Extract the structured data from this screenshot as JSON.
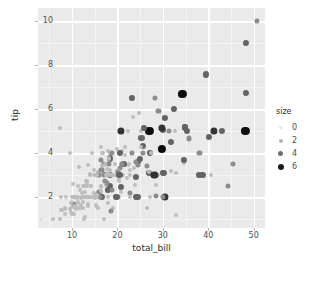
{
  "chart_data": {
    "type": "scatter",
    "title": "",
    "xlabel": "total_bill",
    "ylabel": "tip",
    "xlim": [
      2.5,
      52.5
    ],
    "ylim": [
      0.6,
      10.6
    ],
    "xticks": [
      10,
      20,
      30,
      40,
      50
    ],
    "yticks": [
      2,
      4,
      6,
      8,
      10
    ],
    "grid": true,
    "panel_background": "#eaeaea",
    "grid_color": "#ffffff",
    "legend": {
      "title": "size",
      "position": "right",
      "entries": [
        {
          "label": "0",
          "color": "#e3e3e3",
          "radius": 1.6
        },
        {
          "label": "2",
          "color": "#b4b4b4",
          "radius": 2.0
        },
        {
          "label": "4",
          "color": "#6e6e6e",
          "radius": 2.5
        },
        {
          "label": "6",
          "color": "#1a1a1a",
          "radius": 3.0
        }
      ]
    },
    "color_by": "size",
    "colormap": {
      "1": "#d9d9d9",
      "2": "#bdbdbd",
      "3": "#8c8c8c",
      "4": "#636363",
      "5": "#333333",
      "6": "#0d0d0d"
    },
    "size_by": "size",
    "points": [
      {
        "x": 16.99,
        "y": 1.01,
        "s": 2
      },
      {
        "x": 10.34,
        "y": 1.66,
        "s": 3
      },
      {
        "x": 21.01,
        "y": 3.5,
        "s": 3
      },
      {
        "x": 23.68,
        "y": 3.31,
        "s": 2
      },
      {
        "x": 24.59,
        "y": 3.61,
        "s": 4
      },
      {
        "x": 25.29,
        "y": 4.71,
        "s": 4
      },
      {
        "x": 8.77,
        "y": 2.0,
        "s": 2
      },
      {
        "x": 26.88,
        "y": 3.12,
        "s": 4
      },
      {
        "x": 15.04,
        "y": 1.96,
        "s": 2
      },
      {
        "x": 14.78,
        "y": 3.23,
        "s": 2
      },
      {
        "x": 10.27,
        "y": 1.71,
        "s": 2
      },
      {
        "x": 35.26,
        "y": 5.0,
        "s": 4
      },
      {
        "x": 15.42,
        "y": 1.57,
        "s": 2
      },
      {
        "x": 18.43,
        "y": 3.0,
        "s": 4
      },
      {
        "x": 14.83,
        "y": 3.02,
        "s": 2
      },
      {
        "x": 21.58,
        "y": 3.92,
        "s": 2
      },
      {
        "x": 10.33,
        "y": 1.67,
        "s": 3
      },
      {
        "x": 16.29,
        "y": 3.71,
        "s": 3
      },
      {
        "x": 16.97,
        "y": 3.5,
        "s": 3
      },
      {
        "x": 20.65,
        "y": 3.35,
        "s": 3
      },
      {
        "x": 17.92,
        "y": 4.08,
        "s": 2
      },
      {
        "x": 20.29,
        "y": 2.75,
        "s": 2
      },
      {
        "x": 15.77,
        "y": 2.23,
        "s": 2
      },
      {
        "x": 39.42,
        "y": 7.58,
        "s": 4
      },
      {
        "x": 19.82,
        "y": 3.18,
        "s": 2
      },
      {
        "x": 17.81,
        "y": 2.34,
        "s": 4
      },
      {
        "x": 13.37,
        "y": 2.0,
        "s": 2
      },
      {
        "x": 12.69,
        "y": 2.0,
        "s": 2
      },
      {
        "x": 21.7,
        "y": 4.3,
        "s": 2
      },
      {
        "x": 19.65,
        "y": 3.0,
        "s": 2
      },
      {
        "x": 9.55,
        "y": 1.45,
        "s": 2
      },
      {
        "x": 18.35,
        "y": 2.5,
        "s": 4
      },
      {
        "x": 15.06,
        "y": 3.0,
        "s": 2
      },
      {
        "x": 20.69,
        "y": 2.45,
        "s": 4
      },
      {
        "x": 17.78,
        "y": 3.27,
        "s": 2
      },
      {
        "x": 24.06,
        "y": 3.6,
        "s": 3
      },
      {
        "x": 16.31,
        "y": 2.0,
        "s": 3
      },
      {
        "x": 16.93,
        "y": 3.07,
        "s": 3
      },
      {
        "x": 18.69,
        "y": 2.31,
        "s": 3
      },
      {
        "x": 31.27,
        "y": 5.0,
        "s": 3
      },
      {
        "x": 16.04,
        "y": 2.24,
        "s": 3
      },
      {
        "x": 17.46,
        "y": 2.54,
        "s": 2
      },
      {
        "x": 13.94,
        "y": 3.06,
        "s": 2
      },
      {
        "x": 9.68,
        "y": 1.32,
        "s": 2
      },
      {
        "x": 30.4,
        "y": 5.6,
        "s": 4
      },
      {
        "x": 18.29,
        "y": 3.0,
        "s": 2
      },
      {
        "x": 22.23,
        "y": 5.0,
        "s": 2
      },
      {
        "x": 32.4,
        "y": 6.0,
        "s": 4
      },
      {
        "x": 28.55,
        "y": 2.05,
        "s": 3
      },
      {
        "x": 18.04,
        "y": 3.0,
        "s": 2
      },
      {
        "x": 12.54,
        "y": 2.5,
        "s": 2
      },
      {
        "x": 10.29,
        "y": 2.6,
        "s": 2
      },
      {
        "x": 34.81,
        "y": 5.2,
        "s": 4
      },
      {
        "x": 9.94,
        "y": 1.56,
        "s": 2
      },
      {
        "x": 25.56,
        "y": 4.34,
        "s": 4
      },
      {
        "x": 19.49,
        "y": 3.51,
        "s": 2
      },
      {
        "x": 38.01,
        "y": 3.0,
        "s": 4
      },
      {
        "x": 26.41,
        "y": 1.5,
        "s": 2
      },
      {
        "x": 11.24,
        "y": 1.76,
        "s": 2
      },
      {
        "x": 48.27,
        "y": 6.73,
        "s": 4
      },
      {
        "x": 20.29,
        "y": 3.21,
        "s": 2
      },
      {
        "x": 13.81,
        "y": 2.0,
        "s": 2
      },
      {
        "x": 11.02,
        "y": 1.98,
        "s": 2
      },
      {
        "x": 18.29,
        "y": 3.76,
        "s": 4
      },
      {
        "x": 17.59,
        "y": 2.64,
        "s": 3
      },
      {
        "x": 20.08,
        "y": 3.15,
        "s": 3
      },
      {
        "x": 16.45,
        "y": 2.47,
        "s": 2
      },
      {
        "x": 3.07,
        "y": 1.0,
        "s": 1
      },
      {
        "x": 20.23,
        "y": 2.01,
        "s": 2
      },
      {
        "x": 15.01,
        "y": 2.09,
        "s": 2
      },
      {
        "x": 12.02,
        "y": 1.97,
        "s": 2
      },
      {
        "x": 17.07,
        "y": 3.0,
        "s": 3
      },
      {
        "x": 26.86,
        "y": 3.14,
        "s": 2
      },
      {
        "x": 25.28,
        "y": 5.0,
        "s": 2
      },
      {
        "x": 14.73,
        "y": 2.2,
        "s": 2
      },
      {
        "x": 10.51,
        "y": 1.25,
        "s": 2
      },
      {
        "x": 17.92,
        "y": 3.08,
        "s": 2
      },
      {
        "x": 27.2,
        "y": 4.0,
        "s": 4
      },
      {
        "x": 22.76,
        "y": 3.0,
        "s": 2
      },
      {
        "x": 17.29,
        "y": 2.71,
        "s": 2
      },
      {
        "x": 19.44,
        "y": 3.0,
        "s": 2
      },
      {
        "x": 16.66,
        "y": 3.4,
        "s": 2
      },
      {
        "x": 10.07,
        "y": 1.83,
        "s": 1
      },
      {
        "x": 32.68,
        "y": 5.0,
        "s": 2
      },
      {
        "x": 15.98,
        "y": 2.03,
        "s": 2
      },
      {
        "x": 34.83,
        "y": 5.17,
        "s": 4
      },
      {
        "x": 13.03,
        "y": 2.0,
        "s": 2
      },
      {
        "x": 18.28,
        "y": 4.0,
        "s": 2
      },
      {
        "x": 24.71,
        "y": 5.85,
        "s": 2
      },
      {
        "x": 21.16,
        "y": 3.0,
        "s": 2
      },
      {
        "x": 28.97,
        "y": 3.0,
        "s": 2
      },
      {
        "x": 22.49,
        "y": 3.5,
        "s": 2
      },
      {
        "x": 5.75,
        "y": 1.0,
        "s": 2
      },
      {
        "x": 16.32,
        "y": 4.3,
        "s": 2
      },
      {
        "x": 22.75,
        "y": 3.25,
        "s": 2
      },
      {
        "x": 40.17,
        "y": 4.73,
        "s": 4
      },
      {
        "x": 27.28,
        "y": 4.0,
        "s": 2
      },
      {
        "x": 12.03,
        "y": 1.5,
        "s": 2
      },
      {
        "x": 21.01,
        "y": 3.0,
        "s": 2
      },
      {
        "x": 12.46,
        "y": 1.5,
        "s": 2
      },
      {
        "x": 11.35,
        "y": 2.5,
        "s": 2
      },
      {
        "x": 15.38,
        "y": 3.0,
        "s": 2
      },
      {
        "x": 44.3,
        "y": 2.5,
        "s": 3
      },
      {
        "x": 22.42,
        "y": 3.48,
        "s": 2
      },
      {
        "x": 20.92,
        "y": 4.08,
        "s": 2
      },
      {
        "x": 15.36,
        "y": 1.64,
        "s": 2
      },
      {
        "x": 20.49,
        "y": 4.06,
        "s": 2
      },
      {
        "x": 25.21,
        "y": 4.29,
        "s": 2
      },
      {
        "x": 18.24,
        "y": 3.76,
        "s": 2
      },
      {
        "x": 14.31,
        "y": 4.0,
        "s": 2
      },
      {
        "x": 14.0,
        "y": 3.0,
        "s": 2
      },
      {
        "x": 7.25,
        "y": 1.0,
        "s": 2
      },
      {
        "x": 38.07,
        "y": 4.0,
        "s": 3
      },
      {
        "x": 23.95,
        "y": 2.55,
        "s": 2
      },
      {
        "x": 25.71,
        "y": 4.0,
        "s": 3
      },
      {
        "x": 17.31,
        "y": 3.5,
        "s": 2
      },
      {
        "x": 29.93,
        "y": 5.07,
        "s": 4
      },
      {
        "x": 10.65,
        "y": 1.5,
        "s": 2
      },
      {
        "x": 12.43,
        "y": 1.8,
        "s": 2
      },
      {
        "x": 24.08,
        "y": 2.92,
        "s": 4
      },
      {
        "x": 11.69,
        "y": 2.31,
        "s": 2
      },
      {
        "x": 13.42,
        "y": 1.68,
        "s": 2
      },
      {
        "x": 14.26,
        "y": 2.5,
        "s": 2
      },
      {
        "x": 15.95,
        "y": 2.0,
        "s": 2
      },
      {
        "x": 12.48,
        "y": 2.52,
        "s": 2
      },
      {
        "x": 29.8,
        "y": 4.2,
        "s": 6
      },
      {
        "x": 8.52,
        "y": 1.48,
        "s": 2
      },
      {
        "x": 14.52,
        "y": 2.0,
        "s": 2
      },
      {
        "x": 11.38,
        "y": 2.0,
        "s": 2
      },
      {
        "x": 22.82,
        "y": 2.18,
        "s": 3
      },
      {
        "x": 19.08,
        "y": 1.5,
        "s": 2
      },
      {
        "x": 20.27,
        "y": 2.83,
        "s": 2
      },
      {
        "x": 11.17,
        "y": 1.5,
        "s": 2
      },
      {
        "x": 12.26,
        "y": 2.0,
        "s": 2
      },
      {
        "x": 18.26,
        "y": 3.25,
        "s": 2
      },
      {
        "x": 8.51,
        "y": 1.25,
        "s": 2
      },
      {
        "x": 10.33,
        "y": 2.0,
        "s": 2
      },
      {
        "x": 14.15,
        "y": 2.0,
        "s": 2
      },
      {
        "x": 16.0,
        "y": 2.0,
        "s": 2
      },
      {
        "x": 13.16,
        "y": 2.75,
        "s": 2
      },
      {
        "x": 17.47,
        "y": 3.5,
        "s": 2
      },
      {
        "x": 34.3,
        "y": 6.7,
        "s": 6
      },
      {
        "x": 41.19,
        "y": 5.0,
        "s": 5
      },
      {
        "x": 27.05,
        "y": 5.0,
        "s": 6
      },
      {
        "x": 16.43,
        "y": 2.3,
        "s": 2
      },
      {
        "x": 8.35,
        "y": 1.5,
        "s": 2
      },
      {
        "x": 18.64,
        "y": 1.36,
        "s": 3
      },
      {
        "x": 11.87,
        "y": 1.63,
        "s": 2
      },
      {
        "x": 9.78,
        "y": 1.73,
        "s": 2
      },
      {
        "x": 7.51,
        "y": 2.0,
        "s": 2
      },
      {
        "x": 14.07,
        "y": 2.5,
        "s": 2
      },
      {
        "x": 13.13,
        "y": 2.0,
        "s": 2
      },
      {
        "x": 17.26,
        "y": 2.74,
        "s": 3
      },
      {
        "x": 24.55,
        "y": 2.0,
        "s": 4
      },
      {
        "x": 19.77,
        "y": 2.0,
        "s": 4
      },
      {
        "x": 29.85,
        "y": 5.14,
        "s": 5
      },
      {
        "x": 48.17,
        "y": 5.0,
        "s": 6
      },
      {
        "x": 25.0,
        "y": 3.75,
        "s": 4
      },
      {
        "x": 13.39,
        "y": 2.61,
        "s": 2
      },
      {
        "x": 16.49,
        "y": 2.0,
        "s": 4
      },
      {
        "x": 21.5,
        "y": 3.5,
        "s": 4
      },
      {
        "x": 12.66,
        "y": 2.5,
        "s": 2
      },
      {
        "x": 16.21,
        "y": 2.0,
        "s": 3
      },
      {
        "x": 13.81,
        "y": 2.0,
        "s": 2
      },
      {
        "x": 17.51,
        "y": 3.0,
        "s": 2
      },
      {
        "x": 24.52,
        "y": 3.48,
        "s": 3
      },
      {
        "x": 20.76,
        "y": 2.24,
        "s": 2
      },
      {
        "x": 31.71,
        "y": 4.5,
        "s": 4
      },
      {
        "x": 10.59,
        "y": 1.61,
        "s": 2
      },
      {
        "x": 10.63,
        "y": 2.0,
        "s": 2
      },
      {
        "x": 50.81,
        "y": 10.0,
        "s": 3
      },
      {
        "x": 15.81,
        "y": 3.16,
        "s": 2
      },
      {
        "x": 7.25,
        "y": 5.15,
        "s": 2
      },
      {
        "x": 31.85,
        "y": 3.18,
        "s": 2
      },
      {
        "x": 16.82,
        "y": 4.0,
        "s": 2
      },
      {
        "x": 32.9,
        "y": 3.11,
        "s": 2
      },
      {
        "x": 17.89,
        "y": 2.0,
        "s": 2
      },
      {
        "x": 14.48,
        "y": 2.0,
        "s": 2
      },
      {
        "x": 9.6,
        "y": 4.0,
        "s": 2
      },
      {
        "x": 34.63,
        "y": 3.55,
        "s": 2
      },
      {
        "x": 34.65,
        "y": 3.68,
        "s": 4
      },
      {
        "x": 23.33,
        "y": 5.65,
        "s": 2
      },
      {
        "x": 45.35,
        "y": 3.5,
        "s": 3
      },
      {
        "x": 23.17,
        "y": 6.5,
        "s": 4
      },
      {
        "x": 40.55,
        "y": 3.0,
        "s": 2
      },
      {
        "x": 20.69,
        "y": 5.0,
        "s": 5
      },
      {
        "x": 20.9,
        "y": 3.5,
        "s": 3
      },
      {
        "x": 30.46,
        "y": 2.0,
        "s": 5
      },
      {
        "x": 18.15,
        "y": 3.5,
        "s": 3
      },
      {
        "x": 23.1,
        "y": 4.0,
        "s": 3
      },
      {
        "x": 15.69,
        "y": 1.5,
        "s": 2
      },
      {
        "x": 19.81,
        "y": 4.19,
        "s": 2
      },
      {
        "x": 28.44,
        "y": 2.56,
        "s": 2
      },
      {
        "x": 15.48,
        "y": 2.02,
        "s": 2
      },
      {
        "x": 16.58,
        "y": 4.0,
        "s": 2
      },
      {
        "x": 7.56,
        "y": 1.44,
        "s": 2
      },
      {
        "x": 10.34,
        "y": 2.0,
        "s": 2
      },
      {
        "x": 43.11,
        "y": 5.0,
        "s": 4
      },
      {
        "x": 13.0,
        "y": 2.0,
        "s": 2
      },
      {
        "x": 13.51,
        "y": 2.0,
        "s": 2
      },
      {
        "x": 18.71,
        "y": 4.0,
        "s": 3
      },
      {
        "x": 12.74,
        "y": 2.01,
        "s": 2
      },
      {
        "x": 13.0,
        "y": 2.0,
        "s": 2
      },
      {
        "x": 16.4,
        "y": 2.5,
        "s": 2
      },
      {
        "x": 20.53,
        "y": 4.0,
        "s": 4
      },
      {
        "x": 16.47,
        "y": 3.23,
        "s": 3
      },
      {
        "x": 26.59,
        "y": 3.41,
        "s": 3
      },
      {
        "x": 38.73,
        "y": 3.0,
        "s": 4
      },
      {
        "x": 24.27,
        "y": 2.03,
        "s": 2
      },
      {
        "x": 12.76,
        "y": 2.23,
        "s": 2
      },
      {
        "x": 30.06,
        "y": 2.0,
        "s": 3
      },
      {
        "x": 25.89,
        "y": 5.16,
        "s": 4
      },
      {
        "x": 48.33,
        "y": 9.0,
        "s": 4
      },
      {
        "x": 13.27,
        "y": 2.5,
        "s": 2
      },
      {
        "x": 28.17,
        "y": 6.5,
        "s": 3
      },
      {
        "x": 12.9,
        "y": 1.1,
        "s": 2
      },
      {
        "x": 28.15,
        "y": 3.0,
        "s": 5
      },
      {
        "x": 11.59,
        "y": 1.5,
        "s": 2
      },
      {
        "x": 7.74,
        "y": 1.44,
        "s": 2
      },
      {
        "x": 30.14,
        "y": 3.09,
        "s": 4
      },
      {
        "x": 12.16,
        "y": 2.2,
        "s": 2
      },
      {
        "x": 13.42,
        "y": 3.48,
        "s": 2
      },
      {
        "x": 8.58,
        "y": 1.92,
        "s": 1
      },
      {
        "x": 15.98,
        "y": 3.0,
        "s": 3
      },
      {
        "x": 13.42,
        "y": 1.58,
        "s": 2
      },
      {
        "x": 16.27,
        "y": 2.5,
        "s": 2
      },
      {
        "x": 10.09,
        "y": 2.0,
        "s": 2
      },
      {
        "x": 20.45,
        "y": 3.0,
        "s": 4
      },
      {
        "x": 13.28,
        "y": 2.72,
        "s": 2
      },
      {
        "x": 22.12,
        "y": 2.88,
        "s": 2
      },
      {
        "x": 24.01,
        "y": 2.0,
        "s": 4
      },
      {
        "x": 15.69,
        "y": 3.0,
        "s": 3
      },
      {
        "x": 11.61,
        "y": 3.39,
        "s": 2
      },
      {
        "x": 10.77,
        "y": 1.47,
        "s": 2
      },
      {
        "x": 15.53,
        "y": 3.0,
        "s": 2
      },
      {
        "x": 10.07,
        "y": 1.25,
        "s": 2
      },
      {
        "x": 12.6,
        "y": 1.0,
        "s": 2
      },
      {
        "x": 32.83,
        "y": 1.17,
        "s": 2
      },
      {
        "x": 35.83,
        "y": 4.67,
        "s": 3
      },
      {
        "x": 29.03,
        "y": 5.92,
        "s": 3
      },
      {
        "x": 27.18,
        "y": 2.0,
        "s": 2
      },
      {
        "x": 22.67,
        "y": 2.0,
        "s": 2
      },
      {
        "x": 17.82,
        "y": 1.75,
        "s": 2
      },
      {
        "x": 18.78,
        "y": 3.0,
        "s": 2
      }
    ]
  }
}
